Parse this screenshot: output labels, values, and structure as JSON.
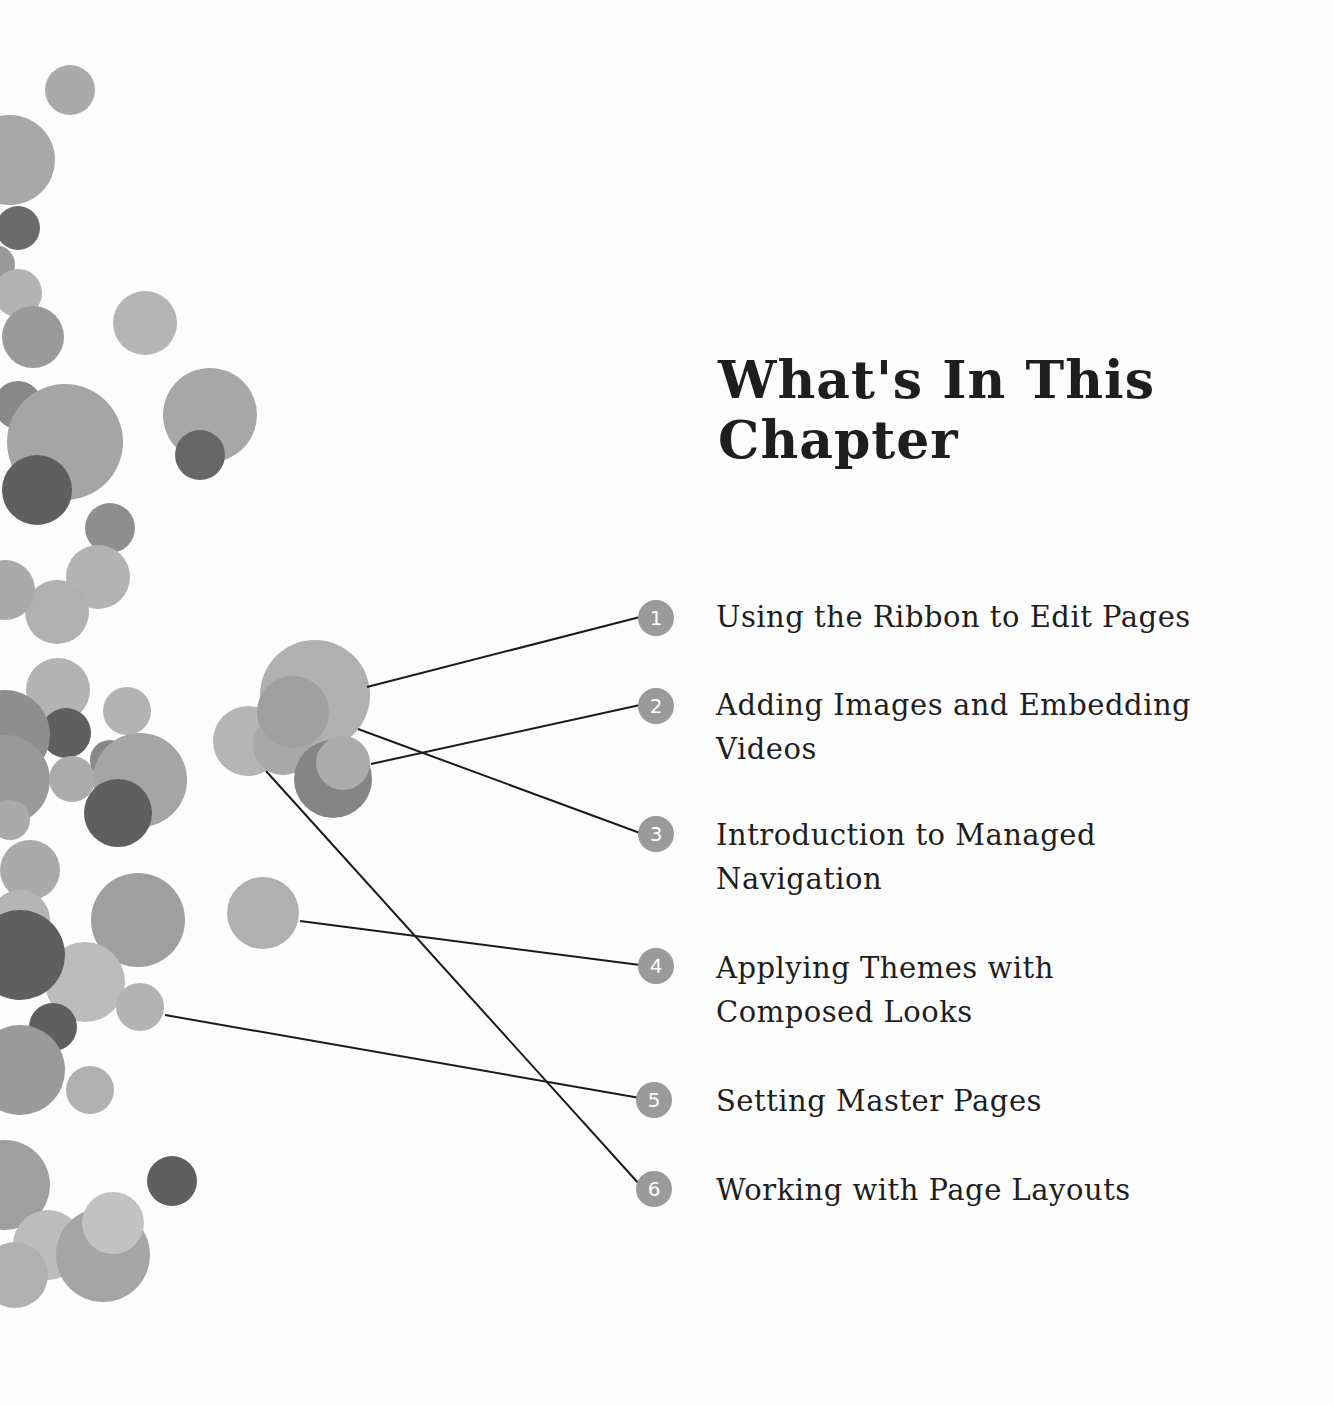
{
  "title": {
    "line1": "What's In This",
    "line2": "Chapter"
  },
  "toc": [
    {
      "number": "1",
      "label": "Using the Ribbon to Edit Pages"
    },
    {
      "number": "2",
      "label": "Adding Images and Embedding Videos"
    },
    {
      "number": "3",
      "label": "Introduction to Managed Navigation"
    },
    {
      "number": "4",
      "label": "Applying Themes with Composed Looks"
    },
    {
      "number": "5",
      "label": "Setting Master Pages"
    },
    {
      "number": "6",
      "label": "Working with Page Layouts"
    }
  ],
  "colors": {
    "light": "#b3b3b3",
    "mid": "#9a9a9a",
    "dark": "#6a6a6a",
    "line": "#1a1a1a",
    "text": "#1e1e1e"
  }
}
